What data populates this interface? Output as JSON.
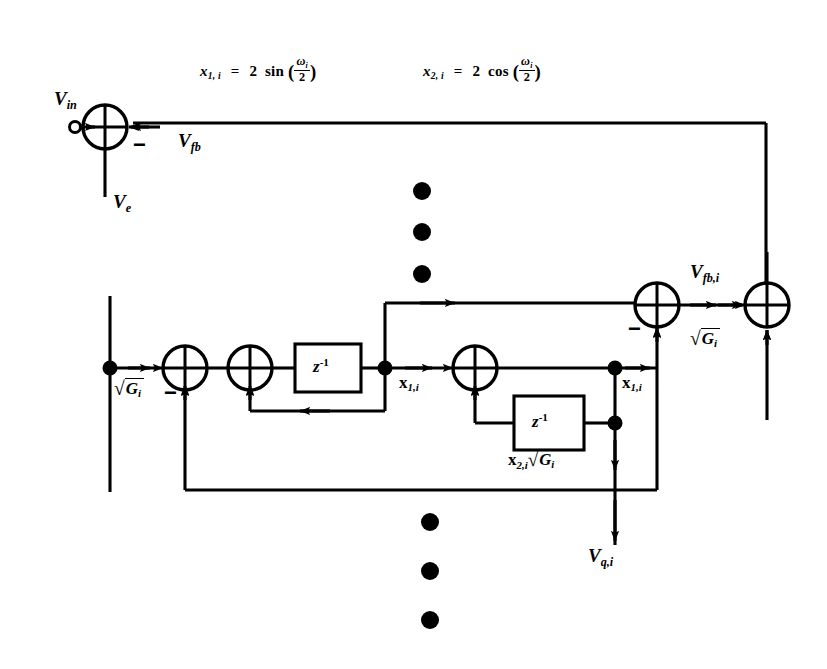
{
  "figure": {
    "background_color": "#ffffff",
    "line_color": "#000000",
    "width": 827,
    "height": 669
  },
  "equations": {
    "eq1": {
      "lhs_var": "x",
      "lhs_sub": "1, i",
      "equals": "=",
      "coefficient": "2",
      "function": "sin",
      "arg_numerator": "ω",
      "arg_numerator_sub": "i",
      "arg_denominator": "2",
      "full_text": "x 1, i  =  2 sin ( ω i / 2 )"
    },
    "eq2": {
      "lhs_var": "x",
      "lhs_sub": "2, i",
      "equals": "=",
      "coefficient": "2",
      "function": "cos",
      "arg_numerator": "ω",
      "arg_numerator_sub": "i",
      "arg_denominator": "2",
      "full_text": "x 2, i  =  2 cos ( ω i / 2 )"
    }
  },
  "signals": {
    "v_in": {
      "base": "V",
      "sub": "in"
    },
    "v_fb": {
      "base": "V",
      "sub": "fb"
    },
    "v_e": {
      "base": "V",
      "sub": "e"
    },
    "v_fb_i": {
      "base": "V",
      "sub": "fb,i"
    },
    "v_q_i": {
      "base": "V",
      "sub": "q,i"
    },
    "x1i_left": {
      "base": "x",
      "sub": "1,i"
    },
    "x1i_right": {
      "base": "x",
      "sub": "1,i"
    },
    "x2i_sqrt_g": {
      "base": "x",
      "sub": "2,i",
      "factor_radical": "√",
      "factor_base": "G",
      "factor_sub": "i"
    }
  },
  "gain_labels": {
    "sqrt_g_left": {
      "radical": "√",
      "base": "G",
      "sub": "i"
    },
    "sqrt_g_right": {
      "radical": "√",
      "base": "G",
      "sub": "i"
    }
  },
  "blocks": {
    "delay_1": {
      "label_base": "z",
      "label_exp": "-1"
    },
    "delay_2": {
      "label_base": "z",
      "label_exp": "-1"
    }
  },
  "summing_junctions": [
    {
      "id": "sum-input",
      "x": 105,
      "y": 127,
      "signs": [
        "+",
        "-"
      ],
      "minus_position": "right"
    },
    {
      "id": "sum-resonator-a",
      "x": 185,
      "y": 368,
      "signs": [
        "+",
        "-"
      ],
      "minus_position": "bottom-left"
    },
    {
      "id": "sum-resonator-b",
      "x": 250,
      "y": 368,
      "signs": [
        "+",
        "+"
      ],
      "minus_position": "none"
    },
    {
      "id": "sum-resonator-c",
      "x": 475,
      "y": 368,
      "signs": [
        "+",
        "+"
      ],
      "minus_position": "none"
    },
    {
      "id": "sum-feedback",
      "x": 657,
      "y": 305,
      "signs": [
        "+",
        "-"
      ],
      "minus_position": "bottom-left"
    },
    {
      "id": "sum-output-bus",
      "x": 767,
      "y": 305,
      "signs": [
        "+",
        "+"
      ],
      "minus_position": "none"
    }
  ],
  "minus_signs": {
    "input_junction": "−",
    "resonator_junction": "−",
    "feedback_junction": "−"
  },
  "ellipsis": {
    "upper": {
      "count": 3,
      "x": 422,
      "ys": [
        191,
        232,
        274
      ],
      "radius": 9
    },
    "lower": {
      "count": 3,
      "x": 430,
      "ys": [
        522,
        571,
        620
      ],
      "radius": 9
    }
  },
  "terminal": {
    "input_terminal": {
      "type": "open-circle",
      "x": 75,
      "y": 127,
      "radius": 5
    }
  }
}
